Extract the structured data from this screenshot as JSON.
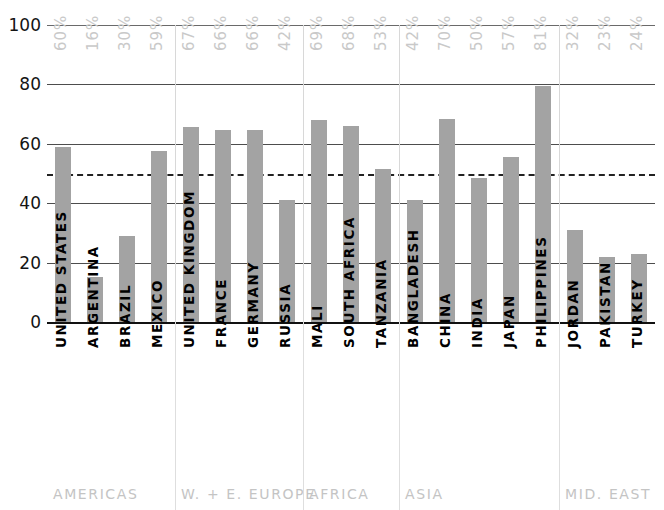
{
  "chart_data": {
    "type": "bar",
    "title": "",
    "subtitle": "",
    "xlabel": "",
    "ylabel": "",
    "ylim": [
      0,
      100
    ],
    "yticks": [
      0,
      20,
      40,
      60,
      80,
      100
    ],
    "grid": true,
    "legend": "none",
    "reference_line": {
      "value": 50,
      "style": "dashed",
      "label": ""
    },
    "categories": [
      "UNITED STATES",
      "ARGENTINA",
      "BRAZIL",
      "MEXICO",
      "UNITED KINGDOM",
      "FRANCE",
      "GERMANY",
      "RUSSIA",
      "MALI",
      "SOUTH AFRICA",
      "TANZANIA",
      "BANGLADESH",
      "CHINA",
      "INDIA",
      "JAPAN",
      "PHILIPPINES",
      "JORDAN",
      "PAKISTAN",
      "TURKEY"
    ],
    "values": [
      59,
      15,
      29,
      57.5,
      65.5,
      64.5,
      64.5,
      41,
      68,
      66,
      51.5,
      41,
      68.5,
      48.5,
      55.5,
      79.5,
      31,
      22,
      23
    ],
    "data_labels": [
      "60%",
      "16%",
      "30%",
      "59%",
      "67%",
      "66%",
      "66%",
      "42%",
      "69%",
      "68%",
      "53%",
      "42%",
      "70%",
      "50%",
      "57%",
      "81%",
      "32%",
      "23%",
      "24%"
    ],
    "groups": [
      {
        "label": "AMERICAS",
        "start": 0,
        "count": 4
      },
      {
        "label": "W. + E. EUROPE",
        "start": 4,
        "count": 4
      },
      {
        "label": "AFRICA",
        "start": 8,
        "count": 3
      },
      {
        "label": "ASIA",
        "start": 11,
        "count": 5
      },
      {
        "label": "MID. EAST",
        "start": 16,
        "count": 3
      }
    ],
    "colors": {
      "bar": "#a3a3a3",
      "grid": "#4d4d4d",
      "axis_text": "#141414",
      "data_label": "#c9c9c9",
      "group_label": "#c4c4c4",
      "reference_line": "#222222",
      "background": "#ffffff"
    }
  }
}
